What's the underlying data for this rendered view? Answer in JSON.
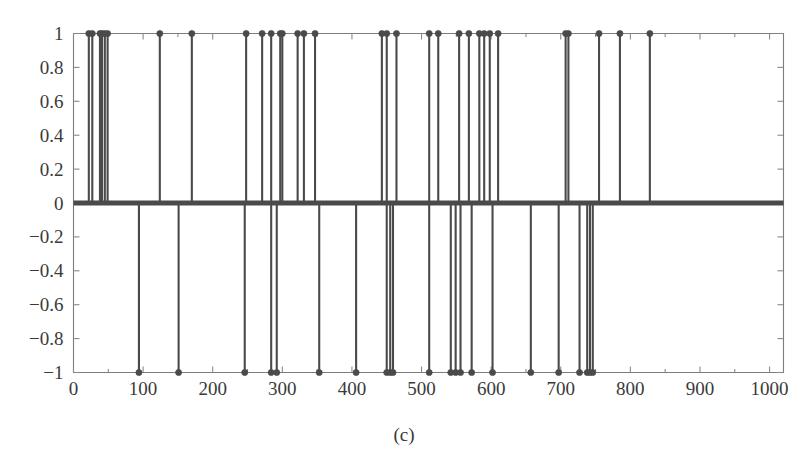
{
  "figure": {
    "caption": "(c)"
  },
  "chart_data": {
    "type": "scatter",
    "subtype": "stem",
    "title": "",
    "xlabel": "",
    "ylabel": "",
    "xlim": [
      0,
      1020
    ],
    "ylim": [
      -1,
      1
    ],
    "grid": false,
    "legend": null,
    "baseline": 0,
    "xticks": [
      0,
      100,
      200,
      300,
      400,
      500,
      600,
      700,
      800,
      900,
      1000
    ],
    "xtick_labels": [
      "0",
      "100",
      "200",
      "300",
      "400",
      "500",
      "600",
      "700",
      "800",
      "900",
      "1000"
    ],
    "yticks": [
      -1,
      -0.8,
      -0.6,
      -0.4,
      -0.2,
      0,
      0.2,
      0.4,
      0.6,
      0.8,
      1
    ],
    "ytick_labels": [
      "−1",
      "−0.8",
      "−0.6",
      "−0.4",
      "−0.2",
      "0",
      "0.2",
      "0.4",
      "0.6",
      "0.8",
      "1"
    ],
    "xminor_ticks": [
      50,
      150,
      250,
      350,
      450,
      550,
      650,
      750,
      850,
      950
    ],
    "series": [
      {
        "name": "impulses",
        "color": "#4a4a4a",
        "points_positive": [
          {
            "x": 22,
            "y": 1
          },
          {
            "x": 27,
            "y": 1
          },
          {
            "x": 38,
            "y": 1
          },
          {
            "x": 41,
            "y": 1
          },
          {
            "x": 45,
            "y": 1
          },
          {
            "x": 49,
            "y": 1
          },
          {
            "x": 124,
            "y": 1
          },
          {
            "x": 170,
            "y": 1
          },
          {
            "x": 248,
            "y": 1
          },
          {
            "x": 271,
            "y": 1
          },
          {
            "x": 284,
            "y": 1
          },
          {
            "x": 297,
            "y": 1
          },
          {
            "x": 300,
            "y": 1
          },
          {
            "x": 322,
            "y": 1
          },
          {
            "x": 331,
            "y": 1
          },
          {
            "x": 347,
            "y": 1
          },
          {
            "x": 443,
            "y": 1
          },
          {
            "x": 450,
            "y": 1
          },
          {
            "x": 464,
            "y": 1
          },
          {
            "x": 511,
            "y": 1
          },
          {
            "x": 524,
            "y": 1
          },
          {
            "x": 554,
            "y": 1
          },
          {
            "x": 568,
            "y": 1
          },
          {
            "x": 583,
            "y": 1
          },
          {
            "x": 590,
            "y": 1
          },
          {
            "x": 598,
            "y": 1
          },
          {
            "x": 610,
            "y": 1
          },
          {
            "x": 707,
            "y": 1
          },
          {
            "x": 711,
            "y": 1
          },
          {
            "x": 755,
            "y": 1
          },
          {
            "x": 785,
            "y": 1
          },
          {
            "x": 828,
            "y": 1
          }
        ],
        "points_negative": [
          {
            "x": 94,
            "y": -1
          },
          {
            "x": 151,
            "y": -1
          },
          {
            "x": 246,
            "y": -1
          },
          {
            "x": 284,
            "y": -1
          },
          {
            "x": 292,
            "y": -1
          },
          {
            "x": 353,
            "y": -1
          },
          {
            "x": 406,
            "y": -1
          },
          {
            "x": 450,
            "y": -1
          },
          {
            "x": 455,
            "y": -1
          },
          {
            "x": 459,
            "y": -1
          },
          {
            "x": 511,
            "y": -1
          },
          {
            "x": 542,
            "y": -1
          },
          {
            "x": 549,
            "y": -1
          },
          {
            "x": 556,
            "y": -1
          },
          {
            "x": 572,
            "y": -1
          },
          {
            "x": 602,
            "y": -1
          },
          {
            "x": 657,
            "y": -1
          },
          {
            "x": 697,
            "y": -1
          },
          {
            "x": 727,
            "y": -1
          },
          {
            "x": 738,
            "y": -1
          },
          {
            "x": 742,
            "y": -1
          },
          {
            "x": 746,
            "y": -1
          }
        ],
        "zero_range": [
          0,
          1020
        ]
      }
    ]
  }
}
